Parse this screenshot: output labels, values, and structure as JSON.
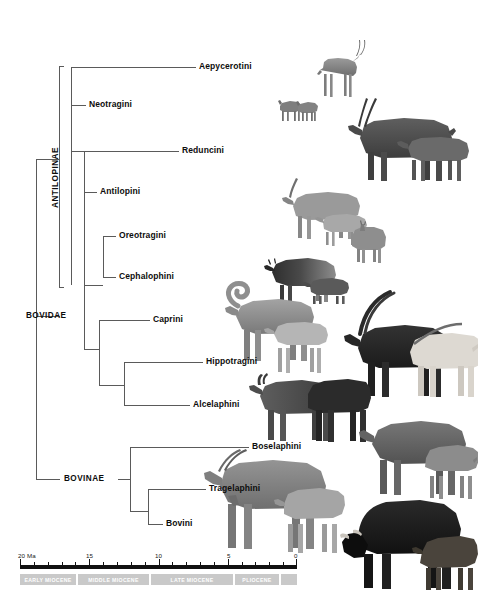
{
  "figure": {
    "type": "phylogenetic-tree",
    "subject": "Bovidae",
    "root_label": "BOVIDAE"
  },
  "tree": {
    "root": {
      "label": "BOVIDAE"
    },
    "clades": [
      {
        "name": "ANTILOPINAE",
        "orientation": "vertical",
        "label": "ANTILOPINAE"
      },
      {
        "name": "BOVINAE",
        "orientation": "horizontal",
        "label": "BOVINAE"
      }
    ],
    "tips": [
      {
        "label": "Aepycerotini",
        "clade": "ANTILOPINAE"
      },
      {
        "label": "Neotragini",
        "clade": "ANTILOPINAE"
      },
      {
        "label": "Reduncini",
        "clade": "ANTILOPINAE"
      },
      {
        "label": "Antilopini",
        "clade": "ANTILOPINAE"
      },
      {
        "label": "Oreotragini",
        "clade": "ANTILOPINAE"
      },
      {
        "label": "Cephalophini",
        "clade": "ANTILOPINAE"
      },
      {
        "label": "Caprini",
        "clade": "ANTILOPINAE"
      },
      {
        "label": "Hippotragini",
        "clade": "ANTILOPINAE"
      },
      {
        "label": "Alcelaphini",
        "clade": "ANTILOPINAE"
      },
      {
        "label": "Boselaphini",
        "clade": "BOVINAE"
      },
      {
        "label": "Tragelaphini",
        "clade": "BOVINAE"
      },
      {
        "label": "Bovini",
        "clade": "BOVINAE"
      }
    ]
  },
  "timescale": {
    "unit_label": "20 Ma",
    "ticks": [
      {
        "value": "20",
        "display": "20 Ma"
      },
      {
        "value": "15",
        "display": "15"
      },
      {
        "value": "10",
        "display": "10"
      },
      {
        "value": "5",
        "display": "5"
      },
      {
        "value": "0",
        "display": "0"
      }
    ],
    "epochs": [
      {
        "label": "EARLY MIOCENE"
      },
      {
        "label": "MIDDLE MIOCENE"
      },
      {
        "label": "LATE MIOCENE"
      },
      {
        "label": "PLIOCENE"
      },
      {
        "label": ""
      }
    ],
    "axis_min": "0",
    "axis_max": "20"
  },
  "colors": {
    "background": "#ffffff",
    "tree_line": "#5a5a5a",
    "text": "#0d0d0d",
    "axis_bar": "#111111",
    "epoch_band": "#c9c9c9",
    "epoch_text": "#ffffff"
  },
  "artwork": [
    {
      "name": "aepycerotini-impala",
      "caption": "Aepycerotini"
    },
    {
      "name": "neotragini-dikdik",
      "caption": "Neotragini"
    },
    {
      "name": "reduncini-waterbuck",
      "caption": "Reduncini"
    },
    {
      "name": "antilopini-gazelle",
      "caption": "Antilopini"
    },
    {
      "name": "oreotragini-klipspringer",
      "caption": "Oreotragini"
    },
    {
      "name": "cephalophini-duiker",
      "caption": "Cephalophini"
    },
    {
      "name": "caprini-bighorn-sheep",
      "caption": "Caprini"
    },
    {
      "name": "hippotragini-sable-oryx",
      "caption": "Hippotragini"
    },
    {
      "name": "alcelaphini-hartebeest-wildebeest",
      "caption": "Alcelaphini"
    },
    {
      "name": "boselaphini-nilgai",
      "caption": "Boselaphini"
    },
    {
      "name": "tragelaphini-eland",
      "caption": "Tragelaphini"
    },
    {
      "name": "bovini-bison",
      "caption": "Bovini"
    }
  ]
}
